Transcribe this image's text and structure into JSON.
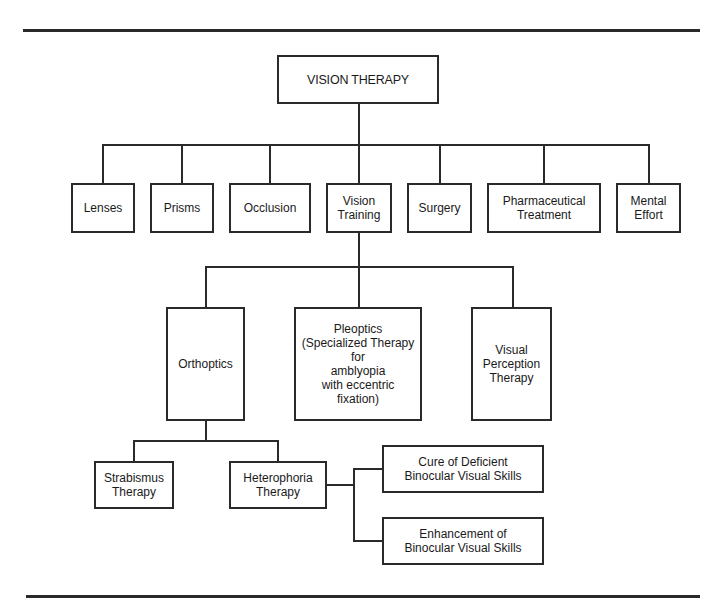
{
  "diagram": {
    "root": {
      "label": "VISION THERAPY"
    },
    "level1": [
      {
        "label": "Lenses"
      },
      {
        "label": "Prisms"
      },
      {
        "label": "Occlusion"
      },
      {
        "label": "Vision\nTraining"
      },
      {
        "label": "Surgery"
      },
      {
        "label": "Pharmaceutical\nTreatment"
      },
      {
        "label": "Mental\nEffort"
      }
    ],
    "level2": [
      {
        "label": "Orthoptics"
      },
      {
        "label": "Pleoptics\n(Specialized Therapy\nfor\namblyopia\nwith eccentric\nfixation)"
      },
      {
        "label": "Visual\nPerception\nTherapy"
      }
    ],
    "level3": [
      {
        "label": "Strabismus\nTherapy"
      },
      {
        "label": "Heterophoria\nTherapy"
      }
    ],
    "level4": [
      {
        "label": "Cure of Deficient\nBinocular Visual Skills"
      },
      {
        "label": "Enhancement of\nBinocular Visual Skills"
      }
    ],
    "edges": [
      [
        "VISION THERAPY",
        "Lenses"
      ],
      [
        "VISION THERAPY",
        "Prisms"
      ],
      [
        "VISION THERAPY",
        "Occlusion"
      ],
      [
        "VISION THERAPY",
        "Vision Training"
      ],
      [
        "VISION THERAPY",
        "Surgery"
      ],
      [
        "VISION THERAPY",
        "Pharmaceutical Treatment"
      ],
      [
        "VISION THERAPY",
        "Mental Effort"
      ],
      [
        "Vision Training",
        "Orthoptics"
      ],
      [
        "Vision Training",
        "Pleoptics"
      ],
      [
        "Vision Training",
        "Visual Perception Therapy"
      ],
      [
        "Orthoptics",
        "Strabismus Therapy"
      ],
      [
        "Orthoptics",
        "Heterophoria Therapy"
      ],
      [
        "Heterophoria Therapy",
        "Cure of Deficient Binocular Visual Skills"
      ],
      [
        "Heterophoria Therapy",
        "Enhancement of Binocular Visual Skills"
      ]
    ]
  }
}
